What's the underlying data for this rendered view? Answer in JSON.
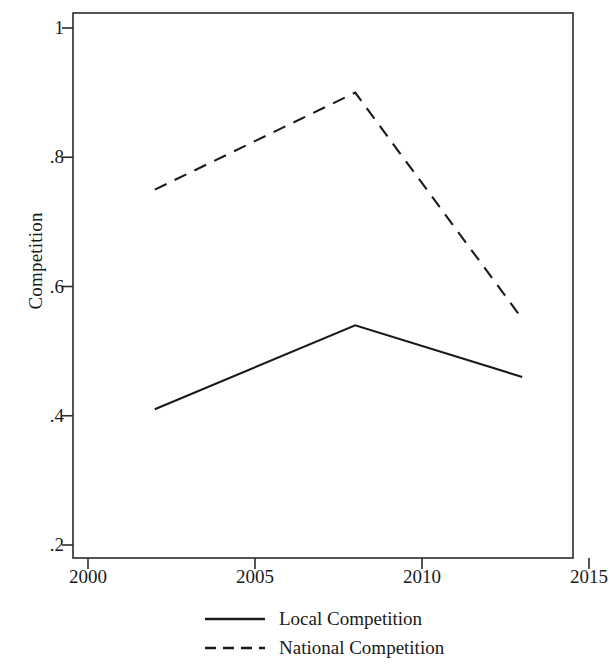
{
  "chart_data": {
    "type": "line",
    "title": "",
    "subtitle": "",
    "xlabel": "",
    "ylabel": "Competition",
    "xlim": [
      2000,
      2015
    ],
    "ylim": [
      0.2,
      1.0
    ],
    "grid": false,
    "legend_position": "bottom",
    "x_ticks": [
      "2000",
      "2005",
      "2010",
      "2015"
    ],
    "x_tick_values": [
      2000,
      2005,
      2010,
      2015
    ],
    "y_ticks": [
      ".2",
      ".4",
      ".6",
      ".8",
      "1"
    ],
    "y_tick_values": [
      0.2,
      0.4,
      0.6,
      0.8,
      1.0
    ],
    "x": [
      2002,
      2008,
      2013
    ],
    "series": [
      {
        "name": "Local Competition",
        "style": "solid",
        "color": "#1a1a1a",
        "values": [
          0.41,
          0.54,
          0.46
        ]
      },
      {
        "name": "National Competition",
        "style": "dashed",
        "color": "#1a1a1a",
        "values": [
          0.75,
          0.9,
          0.55
        ]
      }
    ],
    "legend": [
      {
        "label": "Local Competition",
        "style": "solid"
      },
      {
        "label": "National Competition",
        "style": "dashed"
      }
    ]
  }
}
